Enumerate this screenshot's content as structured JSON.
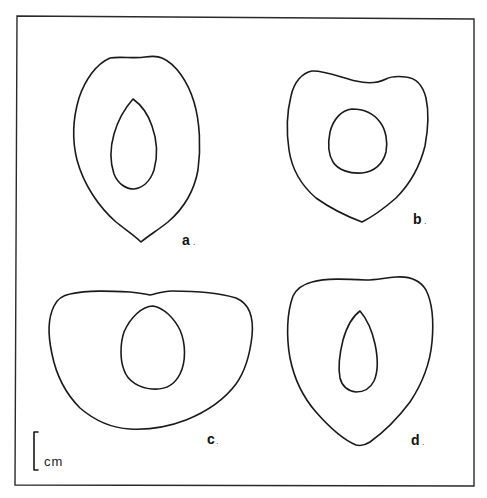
{
  "figure": {
    "panels": [
      {
        "id": "a",
        "label": "a",
        "suffix": "."
      },
      {
        "id": "b",
        "label": "b",
        "suffix": "."
      },
      {
        "id": "c",
        "label": "c",
        "suffix": "."
      },
      {
        "id": "d",
        "label": "d",
        "suffix": "."
      }
    ],
    "scale_bar": {
      "unit": "cm"
    },
    "colors": {
      "line": "#1a1a1a",
      "background": "#ffffff",
      "frame": "#2a2a2a"
    }
  }
}
